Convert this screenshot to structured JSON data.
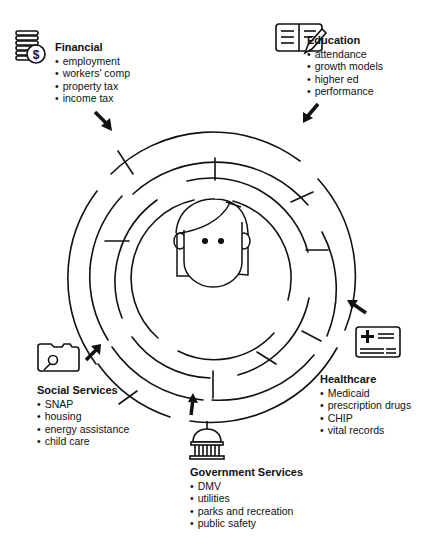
{
  "center": {
    "figure": "person-face"
  },
  "categories": [
    {
      "id": "financial",
      "title": "Financial",
      "icon": "coins-dollar-icon",
      "items": [
        "employment",
        "workers' comp",
        "property tax",
        "income tax"
      ]
    },
    {
      "id": "education",
      "title": "Education",
      "icon": "notebook-pencil-icon",
      "items": [
        "attendance",
        "growth models",
        "higher ed",
        "performance"
      ]
    },
    {
      "id": "healthcare",
      "title": "Healthcare",
      "icon": "health-card-icon",
      "items": [
        "Medicaid",
        "prescription drugs",
        "CHIP",
        "vital records"
      ]
    },
    {
      "id": "government",
      "title": "Government Services",
      "icon": "capitol-building-icon",
      "items": [
        "DMV",
        "utilities",
        "parks and recreation",
        "public safety"
      ]
    },
    {
      "id": "social",
      "title": "Social Services",
      "icon": "folder-search-icon",
      "items": [
        "SNAP",
        "housing",
        "energy assistance",
        "child care"
      ]
    }
  ],
  "colors": {
    "stroke": "#111111",
    "background": "#ffffff"
  }
}
